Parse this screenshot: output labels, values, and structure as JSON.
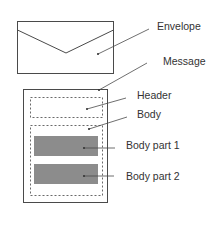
{
  "colors": {
    "line": "#4a4a4a",
    "dashed": "#6a6a6a",
    "part_fill": "#8c8c8c",
    "text": "#333333"
  },
  "labels": {
    "envelope": "Envelope",
    "message": "Message",
    "header": "Header",
    "body": "Body",
    "body_part_1": "Body part 1",
    "body_part_2": "Body part 2"
  },
  "components": [
    {
      "name": "Envelope",
      "shape": "envelope-rectangle"
    },
    {
      "name": "Message",
      "shape": "solid-rectangle",
      "contains": [
        "Header",
        "Body"
      ]
    },
    {
      "name": "Header",
      "shape": "dashed-rectangle"
    },
    {
      "name": "Body",
      "shape": "dashed-rectangle",
      "contains": [
        "Body part 1",
        "Body part 2"
      ]
    },
    {
      "name": "Body part 1",
      "shape": "filled-rectangle"
    },
    {
      "name": "Body part 2",
      "shape": "filled-rectangle"
    }
  ]
}
